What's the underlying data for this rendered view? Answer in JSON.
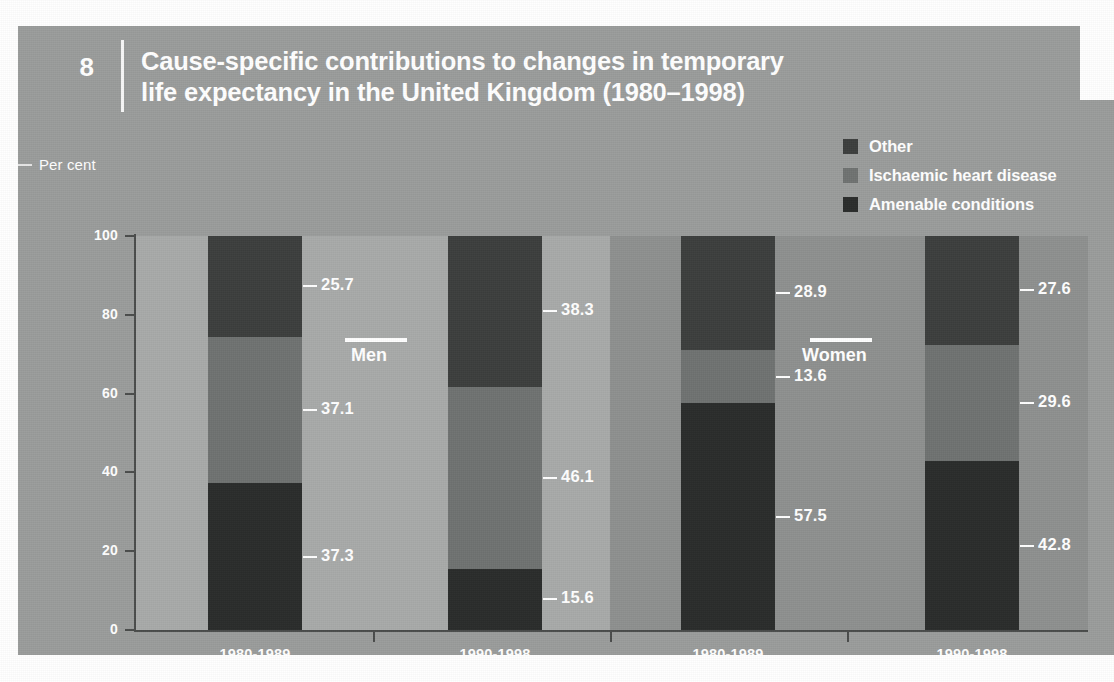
{
  "figure": {
    "number": "8",
    "title_line1": "Cause-specific contributions to changes in temporary",
    "title_line2": "life expectancy in the United Kingdom (1980–1998)",
    "axis_caption": "Per cent"
  },
  "legend": {
    "items": [
      {
        "label": "Other",
        "color": "#3c3e3d"
      },
      {
        "label": "Ischaemic heart disease",
        "color": "#6f7271"
      },
      {
        "label": "Amenable conditions",
        "color": "#2a2c2b"
      }
    ]
  },
  "panels": [
    {
      "name": "Men",
      "bg": "#a8aaa9"
    },
    {
      "name": "Women",
      "bg": "#8e908f"
    }
  ],
  "chart_data": {
    "type": "bar",
    "title": "Cause-specific contributions to changes in temporary life expectancy in the United Kingdom (1980–1998)",
    "subtitle": "",
    "xlabel": "",
    "ylabel": "Per cent",
    "ylim": [
      0,
      100
    ],
    "yticks": [
      "0",
      "20",
      "40",
      "60",
      "80",
      "100"
    ],
    "grid": false,
    "stacked": true,
    "legend_position": "top-right",
    "categories": [
      "1980-1989",
      "1990-1998",
      "1980-1989",
      "1990-1998"
    ],
    "groups": [
      "Men",
      "Men",
      "Women",
      "Women"
    ],
    "series": [
      {
        "name": "Amenable conditions",
        "color": "#2a2c2b",
        "values": [
          37.3,
          15.6,
          57.5,
          42.8
        ]
      },
      {
        "name": "Ischaemic heart disease",
        "color": "#6f7271",
        "values": [
          37.1,
          46.1,
          13.6,
          29.6
        ]
      },
      {
        "name": "Other",
        "color": "#3c3e3d",
        "values": [
          25.7,
          38.3,
          28.9,
          27.6
        ]
      }
    ],
    "bars": [
      {
        "group": "Men",
        "category": "1980-1989",
        "segments": [
          {
            "name": "Amenable conditions",
            "value": 37.3,
            "label": "37.3"
          },
          {
            "name": "Ischaemic heart disease",
            "value": 37.1,
            "label": "37.1"
          },
          {
            "name": "Other",
            "value": 25.7,
            "label": "25.7"
          }
        ]
      },
      {
        "group": "Men",
        "category": "1990-1998",
        "segments": [
          {
            "name": "Amenable conditions",
            "value": 15.6,
            "label": "15.6"
          },
          {
            "name": "Ischaemic heart disease",
            "value": 46.1,
            "label": "46.1"
          },
          {
            "name": "Other",
            "value": 38.3,
            "label": "38.3"
          }
        ]
      },
      {
        "group": "Women",
        "category": "1980-1989",
        "segments": [
          {
            "name": "Amenable conditions",
            "value": 57.5,
            "label": "57.5"
          },
          {
            "name": "Ischaemic heart disease",
            "value": 13.6,
            "label": "13.6"
          },
          {
            "name": "Other",
            "value": 28.9,
            "label": "28.9"
          }
        ]
      },
      {
        "group": "Women",
        "category": "1990-1998",
        "segments": [
          {
            "name": "Amenable conditions",
            "value": 42.8,
            "label": "42.8"
          },
          {
            "name": "Ischaemic heart disease",
            "value": 29.6,
            "label": "29.6"
          },
          {
            "name": "Other",
            "value": 27.6,
            "label": "27.6"
          }
        ]
      }
    ]
  },
  "colors": {
    "card": "#9a9c9b",
    "panel_men": "#a8aaa9",
    "panel_women": "#8e908f",
    "axis": "#4a4c4b",
    "text": "#ffffff"
  }
}
